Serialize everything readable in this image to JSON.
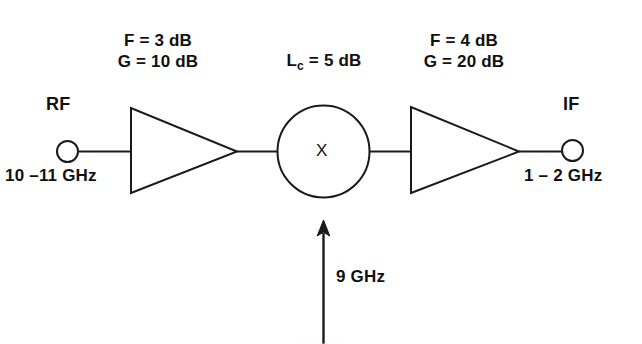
{
  "figure": {
    "type": "rf-receiver-block-diagram",
    "background_color": "#ffffff",
    "line_color": "#1a1a1a",
    "text_color": "#111111"
  },
  "ports": {
    "input": {
      "name": "RF",
      "frequency": "10 –11 GHz"
    },
    "output": {
      "name": "IF",
      "frequency": "1 – 2 GHz"
    },
    "local_oscillator": {
      "frequency": "9 GHz"
    }
  },
  "stages": {
    "amplifier_1": {
      "noise_figure": "F = 3 dB",
      "gain": "G = 10 dB"
    },
    "mixer": {
      "symbol": "X",
      "conversion_loss_prefix": "L",
      "conversion_loss_subscript": "c",
      "conversion_loss_value": " = 5 dB"
    },
    "amplifier_2": {
      "noise_figure": "F = 4 dB",
      "gain": "G = 20 dB"
    }
  },
  "caption": {
    "text": "⎯⎯⎯⎯⎯⎯⎯⎯"
  }
}
